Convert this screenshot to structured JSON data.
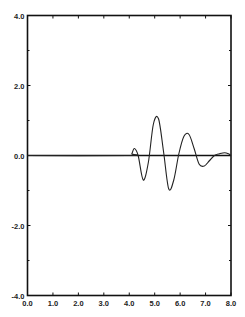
{
  "chart_data": {
    "type": "line",
    "title": "",
    "xlabel": "",
    "ylabel": "",
    "xlim": [
      0.0,
      8.0
    ],
    "ylim": [
      -4.0,
      4.0
    ],
    "grid": false,
    "legend": null,
    "x_ticks": [
      "0.0",
      "1.0",
      "2.0",
      "3.0",
      "4.0",
      "5.0",
      "6.0",
      "7.0",
      "8.0"
    ],
    "y_ticks": [
      "4.0",
      "2.0",
      "0.0",
      "-2.0",
      "-4.0"
    ],
    "y_minor_ticks": [
      3.0,
      1.0,
      -1.0,
      -3.0
    ],
    "baseline_y": 0.0,
    "series": [
      {
        "name": "waveform",
        "x": [
          0.0,
          4.0,
          4.1,
          4.2,
          4.35,
          4.55,
          4.75,
          4.95,
          5.15,
          5.35,
          5.55,
          5.75,
          5.95,
          6.15,
          6.35,
          6.55,
          6.75,
          6.95,
          7.15,
          7.35,
          7.55,
          7.75,
          7.9,
          8.0
        ],
        "values": [
          0.0,
          0.0,
          0.05,
          0.2,
          0.0,
          -0.7,
          -0.2,
          0.9,
          1.05,
          0.1,
          -0.95,
          -0.7,
          0.05,
          0.55,
          0.6,
          0.2,
          -0.25,
          -0.3,
          -0.15,
          0.0,
          0.05,
          0.08,
          0.05,
          0.0
        ]
      }
    ]
  }
}
